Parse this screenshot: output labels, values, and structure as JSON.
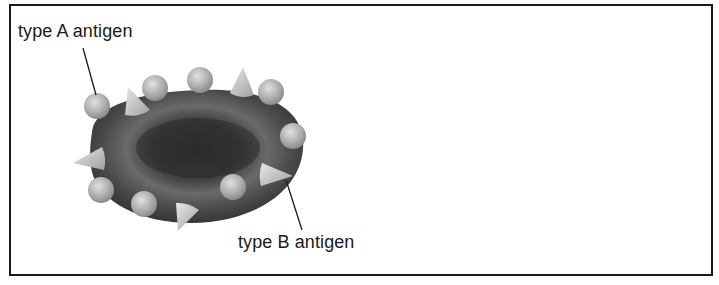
{
  "diagram": {
    "labels": {
      "type_a": "type A antigen",
      "type_b": "type B antigen"
    },
    "cell": {
      "name": "red blood cell",
      "color": "#4a4a4a"
    },
    "antigens": {
      "type_a_shape": "sphere",
      "type_b_shape": "cone",
      "type_a_count": 8,
      "type_b_count": 5,
      "color": "#b8b8b8"
    }
  }
}
